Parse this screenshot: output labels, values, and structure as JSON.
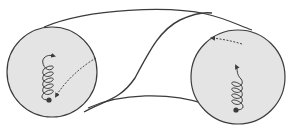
{
  "diagram": {
    "type": "wormhole-illustration",
    "colors": {
      "background": "#ffffff",
      "mouth_fill": "#e4e4e4",
      "stroke": "#3c3c3c",
      "dashed": "#444444"
    },
    "mouths": [
      {
        "name": "left-mouth",
        "cx": 52,
        "cy": 72,
        "r": 45
      },
      {
        "name": "right-mouth",
        "cx": 238,
        "cy": 77,
        "r": 47
      }
    ]
  }
}
